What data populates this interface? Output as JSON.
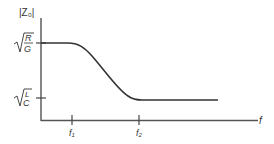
{
  "diagram": {
    "y_axis_label": "|Z₀|",
    "x_axis_label": "f",
    "y_ticks": [
      {
        "label": "√(R/G)",
        "num": "R",
        "den": "G"
      },
      {
        "label": "√(L/C)",
        "num": "L",
        "den": "C"
      }
    ],
    "x_ticks": [
      {
        "label": "f",
        "sub": "1"
      },
      {
        "label": "f",
        "sub": "2"
      }
    ],
    "colors": {
      "line": "#333333",
      "axis": "#444444"
    }
  }
}
